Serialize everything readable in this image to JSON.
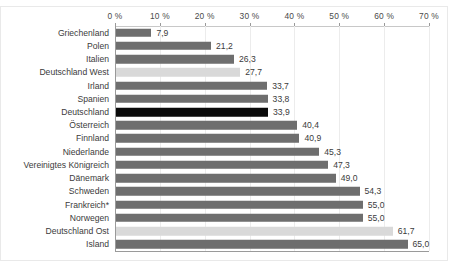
{
  "chart_data": {
    "type": "bar",
    "orientation": "horizontal",
    "title": "",
    "subtitle": "",
    "xlabel": "",
    "ylabel": "",
    "xlim": [
      0,
      70
    ],
    "xtick_step": 10,
    "grid": true,
    "legend": null,
    "value_decimal_separator": ",",
    "axis_ticks": [
      "0 %",
      "10 %",
      "20 %",
      "30 %",
      "40 %",
      "50 %",
      "60 %",
      "70 %"
    ],
    "axis_tick_values": [
      0,
      10,
      20,
      30,
      40,
      50,
      60,
      70
    ],
    "categories": [
      "Griechenland",
      "Polen",
      "Italien",
      "Deutschland West",
      "Irland",
      "Spanien",
      "Deutschland",
      "Österreich",
      "Finnland",
      "Niederlande",
      "Vereinigtes Königreich",
      "Dänemark",
      "Schweden",
      "Frankreich*",
      "Norwegen",
      "Deutschland Ost",
      "Island"
    ],
    "values": [
      7.9,
      21.2,
      26.3,
      27.7,
      33.7,
      33.8,
      33.9,
      40.4,
      40.9,
      45.3,
      47.3,
      49.0,
      54.3,
      55.0,
      55.0,
      61.7,
      65.0
    ],
    "value_labels": [
      "7,9",
      "21,2",
      "26,3",
      "27,7",
      "33,7",
      "33,8",
      "33,9",
      "40,4",
      "40,9",
      "45,3",
      "47,3",
      "49,0",
      "54,3",
      "55,0",
      "55,0",
      "61,7",
      "65,0"
    ],
    "bar_styles": [
      "normal",
      "normal",
      "normal",
      "light",
      "normal",
      "normal",
      "highlight",
      "normal",
      "normal",
      "normal",
      "normal",
      "normal",
      "normal",
      "normal",
      "normal",
      "light",
      "normal"
    ],
    "colors": {
      "bar_normal": "#6e6e6e",
      "bar_light": "#d9d9d9",
      "bar_highlight": "#0a0a0a",
      "axis": "#9a9a9a",
      "grid": "#ececec",
      "text": "#3b3b3b",
      "background": "#ffffff"
    }
  }
}
